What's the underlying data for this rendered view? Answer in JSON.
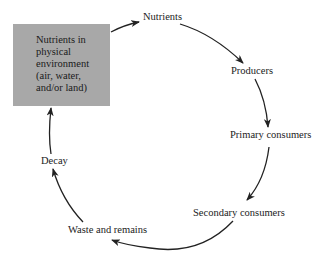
{
  "diagram": {
    "type": "cycle",
    "box": {
      "label": "Nutrients in\nphysical\nenvironment\n(air, water,\nand/or land)",
      "fill": "#a8a8a8"
    },
    "nodes": [
      {
        "id": "nutrients",
        "label": "Nutrients"
      },
      {
        "id": "producers",
        "label": "Producers"
      },
      {
        "id": "primary",
        "label": "Primary consumers"
      },
      {
        "id": "secondary",
        "label": "Secondary consumers"
      },
      {
        "id": "waste",
        "label": "Waste and remains"
      },
      {
        "id": "decay",
        "label": "Decay"
      }
    ],
    "edges": [
      [
        "box",
        "nutrients"
      ],
      [
        "nutrients",
        "producers"
      ],
      [
        "producers",
        "primary"
      ],
      [
        "primary",
        "secondary"
      ],
      [
        "secondary",
        "waste"
      ],
      [
        "waste",
        "decay"
      ],
      [
        "decay",
        "box"
      ]
    ],
    "arrow_color": "#222222"
  }
}
